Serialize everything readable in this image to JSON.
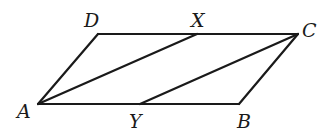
{
  "diagram": {
    "type": "parallelogram",
    "stroke_color": "#1a1a1a",
    "background": "#ffffff",
    "points": {
      "A": {
        "label": "A",
        "x": 38,
        "y": 104
      },
      "B": {
        "label": "B",
        "x": 239,
        "y": 104
      },
      "C": {
        "label": "C",
        "x": 298,
        "y": 34
      },
      "D": {
        "label": "D",
        "x": 98,
        "y": 34
      },
      "X": {
        "label": "X",
        "x": 197,
        "y": 34
      },
      "Y": {
        "label": "Y",
        "x": 140,
        "y": 104
      }
    },
    "segments": [
      {
        "from": "A",
        "to": "B"
      },
      {
        "from": "B",
        "to": "C"
      },
      {
        "from": "C",
        "to": "D"
      },
      {
        "from": "D",
        "to": "A"
      },
      {
        "from": "A",
        "to": "X"
      },
      {
        "from": "Y",
        "to": "C"
      }
    ],
    "labels": {
      "A": "A",
      "B": "B",
      "C": "C",
      "D": "D",
      "X": "X",
      "Y": "Y"
    }
  }
}
